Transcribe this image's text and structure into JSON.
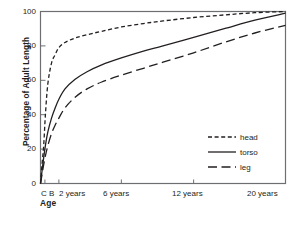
{
  "chart_data": {
    "type": "line",
    "title": "",
    "xlabel": "Age",
    "ylabel": "Percentage of Adult Length",
    "ylim": [
      0,
      100
    ],
    "yticks": [
      0,
      20,
      40,
      60,
      80,
      100
    ],
    "xticks": [
      "C",
      "B",
      "2 years",
      "6 years",
      "12 years",
      "20 years"
    ],
    "xtick_positions": [
      0.0,
      0.018,
      0.075,
      0.33,
      0.625,
      1.0
    ],
    "grid": false,
    "legend_position": "center-right",
    "series": [
      {
        "name": "head",
        "style": "short-dash",
        "x": [
          0.0,
          0.006,
          0.013,
          0.02,
          0.03,
          0.045,
          0.06,
          0.075,
          0.1,
          0.14,
          0.19,
          0.25,
          0.33,
          0.42,
          0.5,
          0.625,
          0.75,
          0.875,
          1.0
        ],
        "values": [
          0,
          11,
          22,
          40,
          58,
          70,
          75,
          79,
          82,
          84.5,
          86.5,
          88.5,
          91,
          93,
          94.5,
          96.5,
          98,
          99.3,
          100
        ]
      },
      {
        "name": "torso",
        "style": "solid",
        "x": [
          0.0,
          0.006,
          0.013,
          0.02,
          0.03,
          0.045,
          0.06,
          0.075,
          0.1,
          0.14,
          0.19,
          0.25,
          0.33,
          0.42,
          0.5,
          0.625,
          0.75,
          0.875,
          1.0
        ],
        "values": [
          0,
          7,
          15,
          22,
          30,
          38,
          44,
          49,
          55,
          60.5,
          65,
          69,
          73,
          77,
          80,
          85,
          90,
          95,
          99
        ]
      },
      {
        "name": "leg",
        "style": "long-dash",
        "x": [
          0.0,
          0.006,
          0.013,
          0.02,
          0.03,
          0.045,
          0.06,
          0.075,
          0.1,
          0.14,
          0.19,
          0.25,
          0.33,
          0.42,
          0.5,
          0.625,
          0.75,
          0.875,
          1.0
        ],
        "values": [
          0,
          5,
          11,
          16,
          22,
          29,
          34,
          38,
          44,
          50,
          55,
          59,
          63,
          67,
          70.5,
          76,
          82,
          87.5,
          92
        ]
      }
    ],
    "legend_entries": [
      {
        "label": "head",
        "style": "short-dash"
      },
      {
        "label": "torso",
        "style": "solid"
      },
      {
        "label": "leg",
        "style": "long-dash"
      }
    ]
  },
  "axis": {
    "y_title": "Percentage of Adult Length",
    "x_title": "Age",
    "y_tick_labels": [
      "100",
      "80",
      "60",
      "40",
      "20",
      "0"
    ],
    "x_tick_labels": [
      "C B",
      "2 years",
      "6 years",
      "12 years",
      "20 years"
    ]
  },
  "colors": {
    "ink": "#231f20",
    "frame": "#6d6e71",
    "background": "#ffffff"
  }
}
